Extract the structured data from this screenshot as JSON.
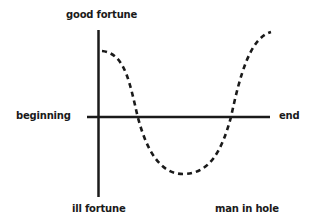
{
  "diagram": {
    "title": "man in hole",
    "type": "story-shape",
    "axes": {
      "y_top_label": "good fortune",
      "y_bottom_label": "ill fortune",
      "x_left_label": "beginning",
      "x_right_label": "end"
    },
    "curve": {
      "style": "dashed",
      "description": "Starts high near good fortune, falls below the baseline into a hole, then rises back above the baseline to end higher than it started",
      "points": [
        {
          "x": 0.0,
          "y": 0.65
        },
        {
          "x": 0.2,
          "y": 0.0
        },
        {
          "x": 0.5,
          "y": -0.6
        },
        {
          "x": 0.8,
          "y": 0.0
        },
        {
          "x": 1.0,
          "y": 0.85
        }
      ]
    },
    "colors": {
      "line": "#1a1a1a",
      "background": "#ffffff"
    }
  }
}
